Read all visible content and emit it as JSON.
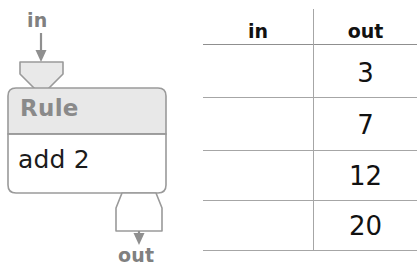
{
  "diagram": {
    "in_label": "in",
    "out_label": "out",
    "rule_title": "Rule",
    "rule_body": "add 2",
    "colors": {
      "outline": "#9a9a9a",
      "header_fill": "#e8e8e8",
      "body_fill": "#ffffff",
      "label_text": "#808080",
      "rule_title_text": "#8a8a8a",
      "rule_body_text": "#1b1b1b"
    }
  },
  "table": {
    "headers": [
      "in",
      "out"
    ],
    "rows": [
      {
        "in": "",
        "out": "3"
      },
      {
        "in": "",
        "out": "7"
      },
      {
        "in": "",
        "out": "12"
      },
      {
        "in": "",
        "out": "20"
      }
    ],
    "line_color": "#a6a6a6"
  }
}
